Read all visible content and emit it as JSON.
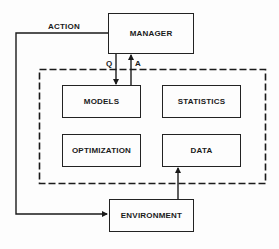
{
  "diagram": {
    "nodes": {
      "manager": "MANAGER",
      "models": "MODELS",
      "statistics": "STATISTICS",
      "optimization": "OPTIMIZATION",
      "data": "DATA",
      "environment": "ENVIRONMENT"
    },
    "edge_labels": {
      "action": "ACTION",
      "query": "Q",
      "answer": "A"
    },
    "edges": [
      {
        "from": "MANAGER",
        "to": "ENVIRONMENT",
        "label": "ACTION"
      },
      {
        "from": "MANAGER",
        "to": "MODELS",
        "label": "Q"
      },
      {
        "from": "MODELS",
        "to": "MANAGER",
        "label": "A"
      },
      {
        "from": "ENVIRONMENT",
        "to": "DATA",
        "label": ""
      }
    ],
    "group": {
      "style": "dashed",
      "members": [
        "MODELS",
        "STATISTICS",
        "OPTIMIZATION",
        "DATA"
      ]
    },
    "colors": {
      "line": "#1a1a1a",
      "background": "#fdfdfd"
    }
  }
}
